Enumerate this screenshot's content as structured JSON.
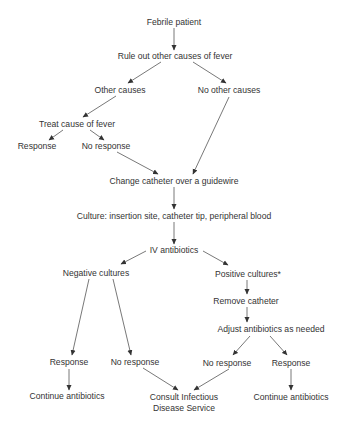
{
  "diagram": {
    "type": "flowchart",
    "colors": {
      "text": "#333333",
      "line": "#555555",
      "background": "#ffffff"
    },
    "nodes": [
      {
        "id": "febrile",
        "label": "Febrile patient",
        "x": 174,
        "y": 22
      },
      {
        "id": "ruleout",
        "label": "Rule out other causes of fever",
        "x": 175,
        "y": 56
      },
      {
        "id": "othercauses",
        "label": "Other causes",
        "x": 120,
        "y": 90
      },
      {
        "id": "nootherc",
        "label": "No other causes",
        "x": 229,
        "y": 90
      },
      {
        "id": "treat",
        "label": "Treat cause of fever",
        "x": 77,
        "y": 124
      },
      {
        "id": "resp1",
        "label": "Response",
        "x": 37,
        "y": 146
      },
      {
        "id": "noresp1",
        "label": "No response",
        "x": 106,
        "y": 146
      },
      {
        "id": "change",
        "label": "Change catheter over a guidewire",
        "x": 174,
        "y": 181
      },
      {
        "id": "culture",
        "label": "Culture: insertion site, catheter tip, peripheral blood",
        "x": 174,
        "y": 216
      },
      {
        "id": "iv",
        "label": "IV antibiotics",
        "x": 174,
        "y": 250
      },
      {
        "id": "neg",
        "label": "Negative cultures",
        "x": 96,
        "y": 273
      },
      {
        "id": "pos",
        "label": "Positive cultures*",
        "x": 248,
        "y": 274
      },
      {
        "id": "remove",
        "label": "Remove catheter",
        "x": 246,
        "y": 301
      },
      {
        "id": "adjust",
        "label": "Adjust antibiotics as needed",
        "x": 271,
        "y": 329
      },
      {
        "id": "resp2",
        "label": "Response",
        "x": 69,
        "y": 362
      },
      {
        "id": "noresp2",
        "label": "No response",
        "x": 135,
        "y": 362
      },
      {
        "id": "noresp3",
        "label": "No response",
        "x": 227,
        "y": 363
      },
      {
        "id": "resp3",
        "label": "Response",
        "x": 291,
        "y": 363
      },
      {
        "id": "cont1",
        "label": "Continue antibiotics",
        "x": 67,
        "y": 396
      },
      {
        "id": "consult",
        "label": "Consult Infectious",
        "label2": "Disease Service",
        "x": 184,
        "y": 403
      },
      {
        "id": "cont2",
        "label": "Continue antibiotics",
        "x": 291,
        "y": 397
      }
    ],
    "edges": [
      {
        "from": "febrile",
        "to": "ruleout",
        "x1": 174,
        "y1": 28,
        "x2": 174,
        "y2": 50
      },
      {
        "from": "ruleout",
        "to": "othercauses",
        "x1": 161,
        "y1": 62,
        "x2": 128,
        "y2": 83
      },
      {
        "from": "ruleout",
        "to": "nootherc",
        "x1": 193,
        "y1": 62,
        "x2": 226,
        "y2": 83
      },
      {
        "from": "othercauses",
        "to": "treat",
        "x1": 116,
        "y1": 96,
        "x2": 83,
        "y2": 117
      },
      {
        "from": "treat",
        "to": "resp1",
        "x1": 63,
        "y1": 130,
        "x2": 49,
        "y2": 140
      },
      {
        "from": "treat",
        "to": "noresp1",
        "x1": 90,
        "y1": 130,
        "x2": 104,
        "y2": 140
      },
      {
        "from": "noresp1",
        "to": "change",
        "x1": 117,
        "y1": 152,
        "x2": 158,
        "y2": 174
      },
      {
        "from": "nootherc",
        "to": "change",
        "x1": 229,
        "y1": 97,
        "x2": 193,
        "y2": 174
      },
      {
        "from": "change",
        "to": "culture",
        "x1": 174,
        "y1": 187,
        "x2": 174,
        "y2": 209
      },
      {
        "from": "culture",
        "to": "iv",
        "x1": 174,
        "y1": 222,
        "x2": 174,
        "y2": 244
      },
      {
        "from": "iv",
        "to": "neg",
        "x1": 146,
        "y1": 251,
        "x2": 121,
        "y2": 264
      },
      {
        "from": "iv",
        "to": "pos",
        "x1": 203,
        "y1": 251,
        "x2": 228,
        "y2": 265
      },
      {
        "from": "pos",
        "to": "remove",
        "x1": 247,
        "y1": 280,
        "x2": 247,
        "y2": 294
      },
      {
        "from": "remove",
        "to": "adjust",
        "x1": 247,
        "y1": 307,
        "x2": 247,
        "y2": 322
      },
      {
        "from": "neg",
        "to": "resp2",
        "x1": 89,
        "y1": 279,
        "x2": 72,
        "y2": 355
      },
      {
        "from": "neg",
        "to": "noresp2",
        "x1": 113,
        "y1": 279,
        "x2": 131,
        "y2": 355
      },
      {
        "from": "adjust",
        "to": "noresp3",
        "x1": 250,
        "y1": 336,
        "x2": 233,
        "y2": 355
      },
      {
        "from": "adjust",
        "to": "resp3",
        "x1": 270,
        "y1": 336,
        "x2": 287,
        "y2": 355
      },
      {
        "from": "resp2",
        "to": "cont1",
        "x1": 69,
        "y1": 369,
        "x2": 69,
        "y2": 390
      },
      {
        "from": "noresp2",
        "to": "consult",
        "x1": 143,
        "y1": 368,
        "x2": 178,
        "y2": 390
      },
      {
        "from": "noresp3",
        "to": "consult",
        "x1": 229,
        "y1": 369,
        "x2": 194,
        "y2": 390
      },
      {
        "from": "resp3",
        "to": "cont2",
        "x1": 291,
        "y1": 369,
        "x2": 291,
        "y2": 390
      }
    ]
  }
}
